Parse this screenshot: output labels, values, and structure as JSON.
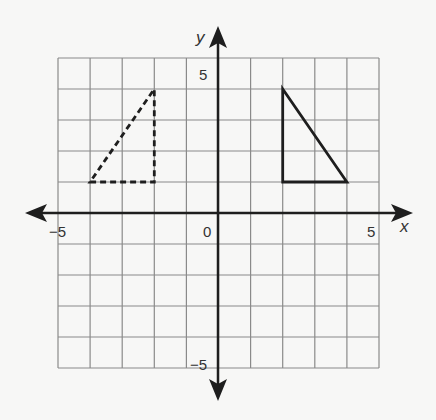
{
  "chart_data": {
    "type": "coordinate-grid",
    "title": "",
    "xlabel": "x",
    "ylabel": "y",
    "xlim": [
      -5,
      5
    ],
    "ylim": [
      -5,
      5
    ],
    "grid": true,
    "tick_labels": {
      "x_min": "−5",
      "x_origin": "0",
      "x_max": "5",
      "y_max": "5",
      "y_min": "−5"
    },
    "shapes": [
      {
        "name": "dashed-triangle",
        "style": "dashed",
        "vertices": [
          [
            -4,
            1
          ],
          [
            -2,
            1
          ],
          [
            -2,
            4
          ]
        ]
      },
      {
        "name": "solid-triangle",
        "style": "solid",
        "vertices": [
          [
            2,
            4
          ],
          [
            2,
            1
          ],
          [
            4,
            1
          ]
        ]
      }
    ]
  },
  "colors": {
    "background": "#f7f7f6",
    "grid": "#8a8a8a",
    "axes": "#1e1e1e",
    "shape": "#1e1e1e",
    "label": "#333333"
  }
}
